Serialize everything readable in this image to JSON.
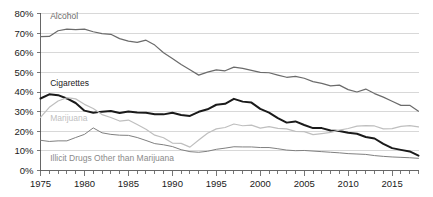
{
  "chart_data": {
    "type": "line",
    "title": "",
    "subtitle": "",
    "xlabel": "",
    "ylabel": "",
    "xlim": [
      1975,
      2018
    ],
    "ylim": [
      0,
      80
    ],
    "grid": true,
    "legend_position": "inline-labels",
    "y_ticks": [
      0,
      10,
      20,
      30,
      40,
      50,
      60,
      70,
      80
    ],
    "y_tick_labels": [
      "0%",
      "10%",
      "20%",
      "30%",
      "40%",
      "50%",
      "60%",
      "70%",
      "80%"
    ],
    "x_ticks": [
      1975,
      1980,
      1985,
      1990,
      1995,
      2000,
      2005,
      2010,
      2015
    ],
    "x_tick_labels": [
      "1975",
      "1980",
      "1985",
      "1990",
      "1995",
      "2000",
      "2005",
      "2010",
      "2015"
    ],
    "x_minor_tick_step": 1,
    "x": [
      1975,
      1976,
      1977,
      1978,
      1979,
      1980,
      1981,
      1982,
      1983,
      1984,
      1985,
      1986,
      1987,
      1988,
      1989,
      1990,
      1991,
      1992,
      1993,
      1994,
      1995,
      1996,
      1997,
      1998,
      1999,
      2000,
      2001,
      2002,
      2003,
      2004,
      2005,
      2006,
      2007,
      2008,
      2009,
      2010,
      2011,
      2012,
      2013,
      2014,
      2015,
      2016,
      2017,
      2018
    ],
    "series": [
      {
        "name": "Alcohol",
        "color": "#6b6b6b",
        "width": 1.2,
        "label_color": "#6b6b6b",
        "values": [
          68.2,
          68.3,
          71.2,
          72.0,
          71.8,
          72.0,
          70.7,
          69.7,
          69.4,
          67.2,
          65.9,
          65.3,
          66.4,
          63.9,
          60.0,
          57.1,
          54.0,
          51.3,
          48.6,
          50.1,
          51.3,
          50.8,
          52.7,
          52.0,
          51.0,
          50.0,
          49.8,
          48.6,
          47.5,
          48.0,
          47.0,
          45.3,
          44.4,
          43.1,
          43.5,
          41.2,
          40.0,
          41.5,
          39.2,
          37.4,
          35.3,
          33.2,
          33.2,
          30.2
        ]
      },
      {
        "name": "Cigarettes",
        "color": "#1a1a1a",
        "width": 2.0,
        "label_color": "#1a1a1a",
        "values": [
          36.7,
          38.8,
          38.4,
          36.7,
          34.4,
          30.5,
          29.4,
          30.0,
          30.3,
          29.3,
          30.1,
          29.6,
          29.4,
          28.7,
          28.6,
          29.4,
          28.3,
          27.8,
          29.9,
          31.2,
          33.5,
          34.0,
          36.5,
          35.1,
          34.6,
          31.4,
          29.5,
          26.7,
          24.4,
          25.0,
          23.2,
          21.6,
          21.6,
          20.4,
          20.1,
          19.2,
          18.7,
          17.1,
          16.3,
          13.6,
          11.4,
          10.5,
          9.7,
          7.6
        ]
      },
      {
        "name": "Marijuana",
        "color": "#bfbfbf",
        "width": 1.2,
        "label_color": "#bfbfbf",
        "values": [
          27.1,
          32.2,
          35.4,
          37.1,
          36.5,
          33.7,
          31.6,
          28.5,
          27.0,
          25.2,
          25.7,
          23.4,
          21.0,
          18.0,
          16.7,
          14.0,
          13.8,
          11.9,
          15.5,
          19.0,
          21.2,
          21.9,
          23.7,
          22.8,
          23.1,
          21.6,
          22.4,
          21.5,
          21.2,
          19.9,
          19.8,
          18.3,
          18.8,
          19.4,
          20.6,
          21.4,
          22.6,
          22.9,
          22.7,
          21.2,
          21.3,
          22.5,
          22.9,
          22.2
        ]
      },
      {
        "name": "Illicit Drugs Other than Marijuana",
        "color": "#808080",
        "width": 1.0,
        "label_color": "#8a8a8a",
        "values": [
          15.4,
          14.8,
          15.1,
          15.1,
          16.8,
          18.4,
          21.7,
          19.2,
          18.4,
          18.0,
          17.9,
          16.8,
          15.3,
          13.7,
          13.1,
          12.2,
          10.6,
          9.6,
          9.3,
          9.8,
          10.8,
          11.4,
          12.1,
          12.0,
          12.0,
          11.7,
          11.7,
          11.1,
          10.4,
          10.1,
          10.2,
          9.9,
          9.6,
          9.3,
          9.0,
          8.6,
          8.4,
          8.2,
          7.6,
          7.2,
          6.9,
          6.7,
          6.5,
          6.2
        ]
      }
    ],
    "annotations": [
      {
        "text": "Alcohol",
        "x": 1976.1,
        "y": 77.2,
        "anchor": "start",
        "series": 0
      },
      {
        "text": "Cigarettes",
        "x": 1976.1,
        "y": 43.3,
        "anchor": "start",
        "series": 1
      },
      {
        "text": "Marijuana",
        "x": 1976.1,
        "y": 25.2,
        "anchor": "start",
        "series": 2
      },
      {
        "text": "Illicit Drugs Other than Marijuana",
        "x": 1976.1,
        "y": 5.0,
        "anchor": "start",
        "series": 3
      }
    ],
    "colors": {
      "grid": "#c8c8c8",
      "axis": "#555555",
      "text": "#1a1a1a",
      "background": "#ffffff"
    }
  }
}
